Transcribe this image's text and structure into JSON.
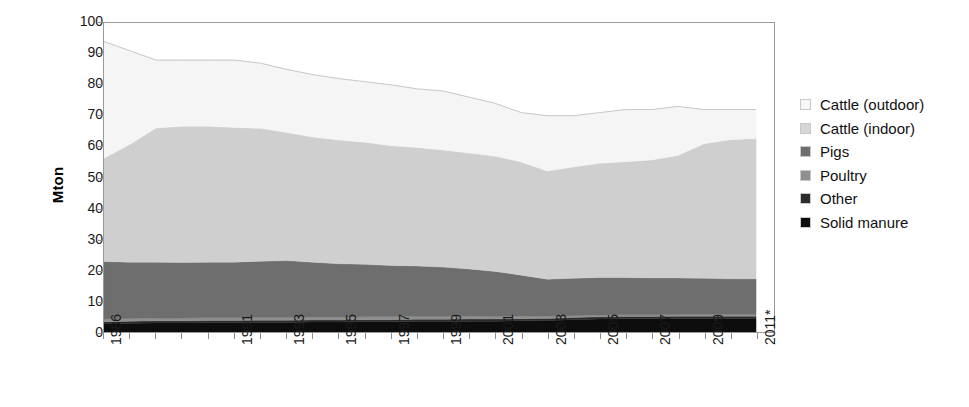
{
  "chart_data": {
    "type": "area",
    "stacked": true,
    "title": "",
    "subtitle": "",
    "xlabel": "",
    "ylabel": "Mton",
    "ylim": [
      0,
      100
    ],
    "ytick_step": 10,
    "ytick_labels": [
      "100",
      "90",
      "80",
      "70",
      "60",
      "50",
      "40",
      "30",
      "20",
      "10",
      "0"
    ],
    "ytick_values": [
      100,
      90,
      80,
      70,
      60,
      50,
      40,
      30,
      20,
      10,
      0
    ],
    "grid": false,
    "legend_position": "right",
    "x": [
      1986,
      1987,
      1988,
      1989,
      1990,
      1991,
      1992,
      1993,
      1994,
      1995,
      1996,
      1997,
      1998,
      1999,
      2000,
      2001,
      2002,
      2003,
      2004,
      2005,
      2006,
      2007,
      2008,
      2009,
      2010,
      2011
    ],
    "xtick_labels": [
      "1986",
      "1991",
      "1993",
      "1995",
      "1997",
      "1999",
      "2001",
      "2003",
      "2005",
      "2007",
      "2009",
      "2011*"
    ],
    "xtick_values": [
      1986,
      1991,
      1993,
      1995,
      1997,
      1999,
      2001,
      2003,
      2005,
      2007,
      2009,
      2011
    ],
    "note": "2011 value is provisional, marked with asterisk",
    "series": [
      {
        "name": "Solid manure",
        "color": "#0d0d0d",
        "stack_order": 1,
        "values": [
          2.6,
          2.8,
          2.9,
          2.9,
          3.0,
          3.0,
          3.1,
          3.1,
          3.2,
          3.2,
          3.3,
          3.3,
          3.4,
          3.4,
          3.5,
          3.5,
          3.6,
          3.7,
          4.0,
          4.2,
          4.3,
          4.3,
          4.4,
          4.4,
          4.4,
          4.4
        ]
      },
      {
        "name": "Other",
        "color": "#2b2b2b",
        "stack_order": 2,
        "values": [
          0.7,
          0.7,
          0.7,
          0.7,
          0.7,
          0.7,
          0.7,
          0.7,
          0.7,
          0.7,
          0.7,
          0.7,
          0.7,
          0.7,
          0.7,
          0.7,
          0.7,
          0.7,
          0.7,
          0.7,
          0.7,
          0.7,
          0.7,
          0.7,
          0.7,
          0.7
        ]
      },
      {
        "name": "Poultry",
        "color": "#8f8f8f",
        "stack_order": 3,
        "values": [
          0.9,
          0.9,
          0.9,
          0.9,
          0.9,
          0.9,
          0.9,
          0.9,
          0.9,
          0.9,
          0.9,
          0.9,
          0.9,
          0.9,
          0.9,
          0.8,
          0.8,
          0.7,
          0.6,
          0.6,
          0.6,
          0.6,
          0.6,
          0.6,
          0.6,
          0.6
        ]
      },
      {
        "name": "Pigs",
        "color": "#6e6e6e",
        "stack_order": 4,
        "values": [
          18.6,
          18.2,
          18.1,
          18.0,
          18.0,
          18.0,
          18.2,
          18.4,
          17.8,
          17.3,
          17.0,
          16.6,
          16.4,
          16.0,
          15.3,
          14.6,
          13.3,
          12.0,
          12.1,
          12.1,
          12.0,
          11.9,
          11.8,
          11.7,
          11.5,
          11.5
        ]
      },
      {
        "name": "Cattle (indoor)",
        "color": "#cfcfcf",
        "stack_order": 5,
        "values": [
          33.4,
          38.2,
          43.4,
          44.1,
          44.0,
          43.6,
          43.0,
          41.5,
          40.5,
          40.0,
          39.5,
          38.8,
          38.3,
          37.9,
          37.5,
          37.3,
          36.6,
          35.0,
          36.0,
          37.0,
          37.5,
          38.2,
          39.6,
          43.5,
          45.0,
          45.4
        ]
      },
      {
        "name": "Cattle (outdoor)",
        "color": "#f5f5f5",
        "stack_order": 6,
        "values": [
          37.8,
          30.2,
          22.0,
          21.4,
          21.4,
          21.8,
          21.1,
          20.4,
          20.2,
          19.9,
          19.6,
          19.7,
          19.0,
          19.1,
          18.1,
          17.1,
          16.0,
          17.9,
          16.6,
          16.4,
          16.9,
          16.3,
          15.9,
          11.1,
          9.8,
          9.4
        ]
      }
    ],
    "totals": [
      94.0,
      91.0,
      88.0,
      88.0,
      88.0,
      88.0,
      87.0,
      85.0,
      83.3,
      82.0,
      81.0,
      80.0,
      78.7,
      78.0,
      76.0,
      74.0,
      71.0,
      70.0,
      70.0,
      71.0,
      72.0,
      72.0,
      73.0,
      72.0,
      72.0,
      72.0
    ]
  },
  "axis": {
    "y_title": "Mton"
  },
  "legend": {
    "items": [
      {
        "label": "Cattle (outdoor)",
        "color": "#f7f7f7"
      },
      {
        "label": "Cattle (indoor)",
        "color": "#d6d6d6"
      },
      {
        "label": "Pigs",
        "color": "#6e6e6e"
      },
      {
        "label": "Poultry",
        "color": "#8f8f8f"
      },
      {
        "label": "Other",
        "color": "#2b2b2b"
      },
      {
        "label": "Solid manure",
        "color": "#0d0d0d"
      }
    ]
  }
}
